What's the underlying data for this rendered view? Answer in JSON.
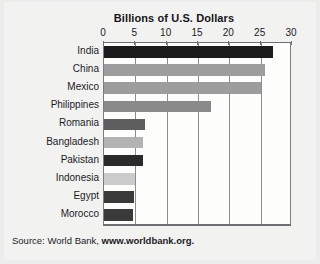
{
  "chart_data": {
    "type": "bar",
    "orientation": "horizontal",
    "title": "Billions of U.S. Dollars",
    "xlabel": "",
    "ylabel": "",
    "xlim": [
      0,
      30
    ],
    "xticks": [
      0,
      5,
      10,
      15,
      20,
      25,
      30
    ],
    "xtick_labels": [
      "0",
      "5",
      "10",
      "15",
      "20",
      "25",
      "30"
    ],
    "grid": true,
    "grid_axis": "x",
    "legend": false,
    "categories": [
      "India",
      "China",
      "Mexico",
      "Philippines",
      "Romania",
      "Bangladesh",
      "Pakistan",
      "Indonesia",
      "Egypt",
      "Morocco"
    ],
    "values": [
      27.0,
      25.7,
      25.0,
      17.0,
      6.5,
      6.3,
      6.2,
      5.0,
      4.8,
      4.7
    ],
    "bar_colors": [
      "#1b1b1b",
      "#9d9d9d",
      "#9d9d9d",
      "#8a8a8a",
      "#5e5e5e",
      "#b3b3b3",
      "#2b2b2b",
      "#cbcbcb",
      "#3a3a3a",
      "#3a3a3a"
    ]
  },
  "source": {
    "prefix": "Source: World Bank, ",
    "site": "www.worldbank.org."
  },
  "colors": {
    "page_background": "#ececed",
    "figure_background": "#f2f2f1",
    "plot_background": "#fdfdfc",
    "axis": "#6f6f73",
    "gridline": "#8c8c8f",
    "text": "#1b1b1f"
  }
}
